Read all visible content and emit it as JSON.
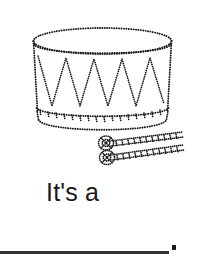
{
  "page": {
    "width": 205,
    "height": 259,
    "background_color": "#ffffff",
    "kind": "tracing-worksheet"
  },
  "caption": {
    "text": "It's a",
    "color": "#1a1a1a",
    "font_size_px": 25
  },
  "artwork": {
    "name": "drum-with-drumsticks",
    "style": "dotted-outline",
    "ink_color": "#1a1a1a",
    "parts": [
      {
        "name": "drum-top-ellipse",
        "cx": 102.5,
        "cy": 41,
        "rx": 69,
        "ry": 13
      },
      {
        "name": "drum-body",
        "top_y": 41,
        "bottom_y": 112
      },
      {
        "name": "drum-zigzag",
        "peaks": 5
      },
      {
        "name": "drum-bottom-rim",
        "cx": 102.5,
        "cy": 114,
        "rx": 66,
        "ry": 11
      },
      {
        "name": "drum-bottom-edge",
        "cx": 102.5,
        "cy": 122,
        "rx": 66,
        "ry": 11
      },
      {
        "name": "drumstick-upper",
        "x1": 104,
        "y1": 140,
        "x2": 184,
        "y2": 133
      },
      {
        "name": "drumstick-lower",
        "x1": 104,
        "y1": 155,
        "x2": 184,
        "y2": 146
      }
    ]
  },
  "writing_line": {
    "name": "handwriting-rule",
    "x": 0,
    "y": 251,
    "width": 169,
    "thickness": 3,
    "color": "#333333"
  },
  "end_marker": {
    "name": "end-dot",
    "x": 172,
    "y": 245,
    "size": 4,
    "color": "#1a1a1a"
  }
}
